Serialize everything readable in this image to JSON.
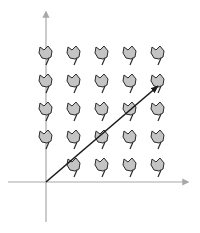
{
  "diagram": {
    "type": "vector-field-with-trajectory",
    "origin": {
      "x": 46,
      "y": 182
    },
    "axes": {
      "color": "#a8a8a8",
      "x_axis": {
        "x1": 8,
        "x2": 188,
        "y": 182
      },
      "y_axis": {
        "x": 46,
        "y1": 12,
        "y2": 222
      }
    },
    "grid": {
      "columns": [
        46,
        74,
        102,
        130,
        158
      ],
      "rows": [
        54,
        82,
        110,
        138,
        166
      ],
      "skip": [
        [
          0,
          4
        ]
      ]
    },
    "glyph": {
      "name": "field-glyph",
      "fill": "#c4c4c4",
      "stroke": "#2a2a2a"
    },
    "trajectory": {
      "color": "#1a1a1a",
      "from": {
        "x": 46,
        "y": 182
      },
      "to": {
        "x": 158,
        "y": 86
      }
    }
  }
}
